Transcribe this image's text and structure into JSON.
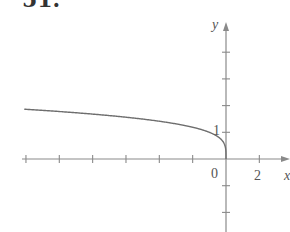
{
  "problem_number": "51.",
  "axes": {
    "x_label": "x",
    "y_label": "y",
    "origin_label": "0",
    "x_tick_label": "2",
    "y_tick_label": "1"
  },
  "colors": {
    "axis": "#8a8a8a",
    "curve": "#6e6e6e",
    "text": "#555555"
  },
  "chart_data": {
    "type": "line",
    "title": "",
    "xlabel": "x",
    "ylabel": "y",
    "function": "y = (-x)^(1/4)",
    "x": [
      -12,
      -10,
      -8,
      -6,
      -4,
      -2,
      -1,
      -0.5,
      -0.1,
      0
    ],
    "series": [
      {
        "name": "curve",
        "values": [
          1.86,
          1.78,
          1.68,
          1.57,
          1.41,
          1.19,
          1.0,
          0.84,
          0.56,
          0
        ]
      }
    ],
    "x_ticks": [
      -12,
      -10,
      -8,
      -6,
      -4,
      -2,
      0,
      2
    ],
    "x_tick_labels": {
      "0": "0",
      "2": "2"
    },
    "y_ticks": [
      -2,
      -1,
      1,
      2,
      3,
      4
    ],
    "y_tick_labels": {
      "1": "1"
    },
    "xlim": [
      -13.5,
      3.8
    ],
    "ylim": [
      -2.7,
      5.5
    ],
    "grid": false,
    "legend": null
  }
}
